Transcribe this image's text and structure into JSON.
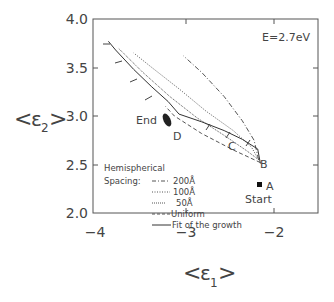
{
  "chart_data": {
    "type": "line",
    "title": "",
    "annotation": "E=2.7eV",
    "xlabel": "<ε1>",
    "ylabel": "<ε2>",
    "xlim": [
      -4.0,
      -1.5
    ],
    "ylim": [
      2.0,
      4.0
    ],
    "xticks": [
      "-4",
      "-3",
      "-2"
    ],
    "yticks": [
      "2.0",
      "2.5",
      "3.0",
      "3.5",
      "4.0"
    ],
    "grid": false,
    "legend_position": "lower left inside",
    "legend_title": [
      "Hemispherical",
      "Spacing:"
    ],
    "points": [
      {
        "label": "A",
        "sublabel": "Start",
        "x": -2.15,
        "y": 2.51
      },
      {
        "label": "B",
        "x": -2.18,
        "y": 2.66
      },
      {
        "label": "C",
        "x": -2.55,
        "y": 2.85
      },
      {
        "label": "D",
        "x": -3.05,
        "y": 3.02
      },
      {
        "label": "End",
        "x": -3.17,
        "y": 3.15
      }
    ],
    "series": [
      {
        "name": "200Å",
        "style": "dash-dot",
        "x": [
          -2.17,
          -2.22,
          -2.35,
          -2.55,
          -2.8,
          -3.0
        ],
        "y": [
          2.55,
          2.75,
          2.95,
          3.2,
          3.45,
          3.62
        ]
      },
      {
        "name": "100Å",
        "style": "dotted",
        "x": [
          -2.17,
          -2.25,
          -2.45,
          -2.75,
          -3.05,
          -3.35,
          -3.55
        ],
        "y": [
          2.55,
          2.68,
          2.85,
          3.05,
          3.28,
          3.5,
          3.65
        ]
      },
      {
        "name": "50Å",
        "style": "dotted-fine",
        "x": [
          -2.17,
          -2.3,
          -2.55,
          -2.85,
          -3.15,
          -3.45,
          -3.72
        ],
        "y": [
          2.55,
          2.64,
          2.8,
          2.98,
          3.2,
          3.45,
          3.7
        ]
      },
      {
        "name": "Uniform",
        "style": "dashed",
        "x": [
          -2.15,
          -2.45,
          -2.8,
          -3.1,
          -3.2
        ],
        "y": [
          2.52,
          2.65,
          2.82,
          3.0,
          3.1
        ]
      },
      {
        "name": "Fit of the growth",
        "style": "solid",
        "x": [
          -2.15,
          -2.18,
          -2.35,
          -2.55,
          -2.8,
          -3.05,
          -3.17,
          -3.35,
          -3.55,
          -3.75,
          -3.83
        ],
        "y": [
          2.51,
          2.66,
          2.76,
          2.85,
          2.94,
          3.02,
          3.15,
          3.3,
          3.48,
          3.68,
          3.77
        ]
      }
    ]
  },
  "legend": {
    "title_line1": "Hemispherical",
    "title_line2": "Spacing:",
    "items": [
      "200Å",
      "100Å",
      "50Å",
      "Uniform",
      "Fit of the growth"
    ]
  },
  "labels": {
    "annotation": "E=2.7eV",
    "xaxis": "ε",
    "xaxis_sub": "1",
    "yaxis": "ε",
    "yaxis_sub": "2",
    "point_A": "A",
    "point_B": "B",
    "point_C": "C",
    "point_D": "D",
    "end": "End",
    "start": "Start",
    "xtick_0": "−4",
    "xtick_1": "−3",
    "xtick_2": "−2",
    "ytick_0": "2.0",
    "ytick_1": "2.5",
    "ytick_2": "3.0",
    "ytick_3": "3.5",
    "ytick_4": "4.0"
  }
}
